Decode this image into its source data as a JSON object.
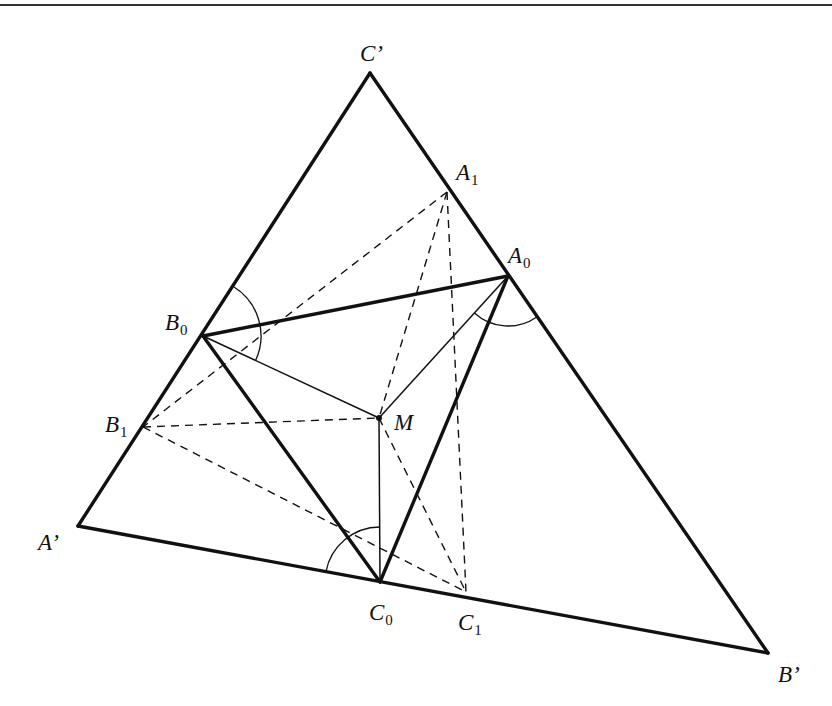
{
  "diagram": {
    "title": "",
    "points": {
      "C_prime": {
        "label": "C’",
        "sub": "",
        "x": 370,
        "y": 73,
        "lx": 360,
        "ly": 61
      },
      "A_prime": {
        "label": "A’",
        "sub": "",
        "x": 78,
        "y": 526,
        "lx": 38,
        "ly": 550
      },
      "B_prime": {
        "label": "B’",
        "sub": "",
        "x": 768,
        "y": 653,
        "lx": 778,
        "ly": 682
      },
      "A1": {
        "label": "A",
        "sub": "1",
        "x": 447,
        "y": 192,
        "lx": 456,
        "ly": 180
      },
      "A0": {
        "label": "A",
        "sub": "0",
        "x": 508,
        "y": 276,
        "lx": 508,
        "ly": 263
      },
      "B0": {
        "label": "B",
        "sub": "0",
        "x": 203,
        "y": 336,
        "lx": 165,
        "ly": 330
      },
      "B1": {
        "label": "B",
        "sub": "1",
        "x": 143,
        "y": 427,
        "lx": 105,
        "ly": 432
      },
      "M": {
        "label": "M",
        "sub": "",
        "x": 379,
        "y": 418,
        "lx": 394,
        "ly": 430
      },
      "C0": {
        "label": "C",
        "sub": "0",
        "x": 380,
        "y": 582,
        "lx": 369,
        "ly": 620
      },
      "C1": {
        "label": "C",
        "sub": "1",
        "x": 466,
        "y": 592,
        "lx": 458,
        "ly": 630
      }
    },
    "thick_segments": [
      [
        "A_prime",
        "B_prime"
      ],
      [
        "B_prime",
        "C_prime"
      ],
      [
        "C_prime",
        "A_prime"
      ],
      [
        "A0",
        "B0"
      ],
      [
        "B0",
        "C0"
      ],
      [
        "C0",
        "A0"
      ]
    ],
    "thin_segments": [
      [
        "M",
        "A0"
      ],
      [
        "M",
        "B0"
      ],
      [
        "M",
        "C0"
      ]
    ],
    "dashed_segments": [
      [
        "A1",
        "B1"
      ],
      [
        "A1",
        "M"
      ],
      [
        "A1",
        "C1"
      ],
      [
        "B1",
        "M"
      ],
      [
        "B1",
        "C1"
      ],
      [
        "M",
        "C1"
      ]
    ],
    "angle_arcs": [
      {
        "vertex": "B0",
        "from": "C_prime",
        "to": "M",
        "radius": 58
      },
      {
        "vertex": "A0",
        "from": "M",
        "to": "B_prime",
        "radius": 50
      },
      {
        "vertex": "C0",
        "from": "A_prime",
        "to": "M",
        "radius": 55
      }
    ],
    "top_rule": {
      "y": 5
    }
  }
}
